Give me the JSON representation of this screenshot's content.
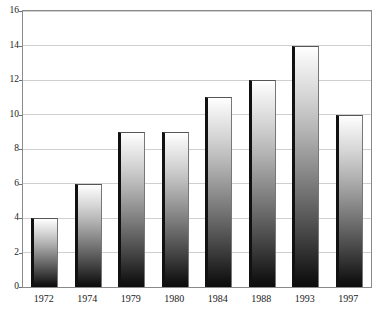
{
  "chart_data": {
    "type": "bar",
    "title": "",
    "title_note": "cropped off at top edge of screenshot, illegible",
    "xlabel": "",
    "ylabel": "",
    "categories": [
      "1972",
      "1974",
      "1979",
      "1980",
      "1984",
      "1988",
      "1993",
      "1997"
    ],
    "values": [
      4,
      6,
      9,
      9,
      11,
      12,
      14,
      10
    ],
    "ylim": [
      0,
      16
    ],
    "ytick_labels": [
      "0",
      "2",
      "4",
      "6",
      "8",
      "10",
      "12",
      "14",
      "16"
    ],
    "ytick_values": [
      0,
      2,
      4,
      6,
      8,
      10,
      12,
      14,
      16
    ],
    "grid": true,
    "grid_axis": "y",
    "legend": false,
    "series": [
      {
        "name": "",
        "values": [
          4,
          6,
          9,
          9,
          11,
          12,
          14,
          10
        ]
      }
    ]
  },
  "style": {
    "bar_fill_top": "#ffffff",
    "bar_fill_bottom": "#0d0d0d",
    "bar_edge_left": "#111111",
    "bar_edge_top": "#555555",
    "gridline_color": "#cfcfcf",
    "frame_color": "#8a8a8a",
    "text_color": "#1a1a1a",
    "background": "#ffffff"
  }
}
